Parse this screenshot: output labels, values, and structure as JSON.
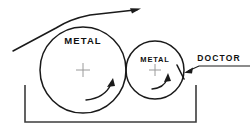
{
  "diagram": {
    "background_color": "#ffffff",
    "line_color": "#1a1a1a",
    "cross_color": "#9a9a9a",
    "tank_color": "#3c3c3c",
    "labels": {
      "large_roll": "METAL",
      "small_roll": "METAL",
      "doctor": "DOCTOR"
    },
    "rolls": [
      {
        "name": "large-metal-roll",
        "label": "METAL",
        "cx": 83,
        "cy": 70,
        "r": 43,
        "rotation": "clockwise"
      },
      {
        "name": "small-metal-roll",
        "label": "METAL",
        "cx": 155,
        "cy": 70,
        "r": 29,
        "rotation": "clockwise"
      }
    ],
    "web": {
      "name": "web-path",
      "direction": "left-to-right",
      "entry_point": [
        13,
        51
      ],
      "exit_point": [
        140,
        9
      ],
      "arrowhead": "right"
    },
    "tank": {
      "name": "coating-tank",
      "left_x": 25,
      "right_x": 196,
      "top_y": 85,
      "bottom_y": 122
    },
    "doctor_blade": {
      "name": "doctor-blade",
      "contact_point": [
        178,
        66
      ],
      "tip_point": [
        183,
        79
      ],
      "leader_from": [
        249,
        66
      ],
      "leader_corner": [
        200,
        66
      ],
      "arrow_tip": [
        185,
        71
      ]
    }
  }
}
